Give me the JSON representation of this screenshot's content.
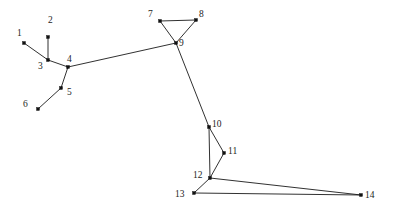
{
  "figure": {
    "type": "node-link-graph",
    "background_color": "#ffffff",
    "edge_color": "#1a1a1a",
    "node_color": "#111111",
    "label_color": "#1d1d1d",
    "width": 399,
    "height": 211
  },
  "graph_data": {
    "type": "graph",
    "title": "",
    "node_count": 14,
    "edge_count": 14,
    "nodes": [
      {
        "id": 1,
        "label": "1",
        "x": 24,
        "y": 43,
        "label_x": 17,
        "label_y": 28
      },
      {
        "id": 2,
        "label": "2",
        "x": 48,
        "y": 37,
        "label_x": 48,
        "label_y": 15
      },
      {
        "id": 3,
        "label": "3",
        "x": 48,
        "y": 60,
        "label_x": 38,
        "label_y": 61
      },
      {
        "id": 4,
        "label": "4",
        "x": 68,
        "y": 67,
        "label_x": 67,
        "label_y": 54
      },
      {
        "id": 5,
        "label": "5",
        "x": 61,
        "y": 88,
        "label_x": 67,
        "label_y": 87
      },
      {
        "id": 6,
        "label": "6",
        "x": 38,
        "y": 109,
        "label_x": 23,
        "label_y": 99
      },
      {
        "id": 7,
        "label": "7",
        "x": 160,
        "y": 21,
        "label_x": 148,
        "label_y": 9
      },
      {
        "id": 8,
        "label": "8",
        "x": 196,
        "y": 20,
        "label_x": 199,
        "label_y": 9
      },
      {
        "id": 9,
        "label": "9",
        "x": 176,
        "y": 43,
        "label_x": 179,
        "label_y": 38
      },
      {
        "id": 10,
        "label": "10",
        "x": 209,
        "y": 127,
        "label_x": 212,
        "label_y": 119
      },
      {
        "id": 11,
        "label": "11",
        "x": 224,
        "y": 153,
        "label_x": 228,
        "label_y": 146
      },
      {
        "id": 12,
        "label": "12",
        "x": 210,
        "y": 178,
        "label_x": 193,
        "label_y": 170
      },
      {
        "id": 13,
        "label": "13",
        "x": 194,
        "y": 193,
        "label_x": 175,
        "label_y": 189
      },
      {
        "id": 14,
        "label": "14",
        "x": 361,
        "y": 195,
        "label_x": 365,
        "label_y": 190
      }
    ],
    "edges": [
      {
        "source": 1,
        "target": 3
      },
      {
        "source": 2,
        "target": 3
      },
      {
        "source": 3,
        "target": 4
      },
      {
        "source": 4,
        "target": 5
      },
      {
        "source": 4,
        "target": 9
      },
      {
        "source": 5,
        "target": 6
      },
      {
        "source": 7,
        "target": 8
      },
      {
        "source": 7,
        "target": 9
      },
      {
        "source": 8,
        "target": 9
      },
      {
        "source": 9,
        "target": 10
      },
      {
        "source": 10,
        "target": 11
      },
      {
        "source": 10,
        "target": 12
      },
      {
        "source": 11,
        "target": 12
      },
      {
        "source": 12,
        "target": 13
      },
      {
        "source": 12,
        "target": 14
      },
      {
        "source": 13,
        "target": 14
      }
    ]
  }
}
